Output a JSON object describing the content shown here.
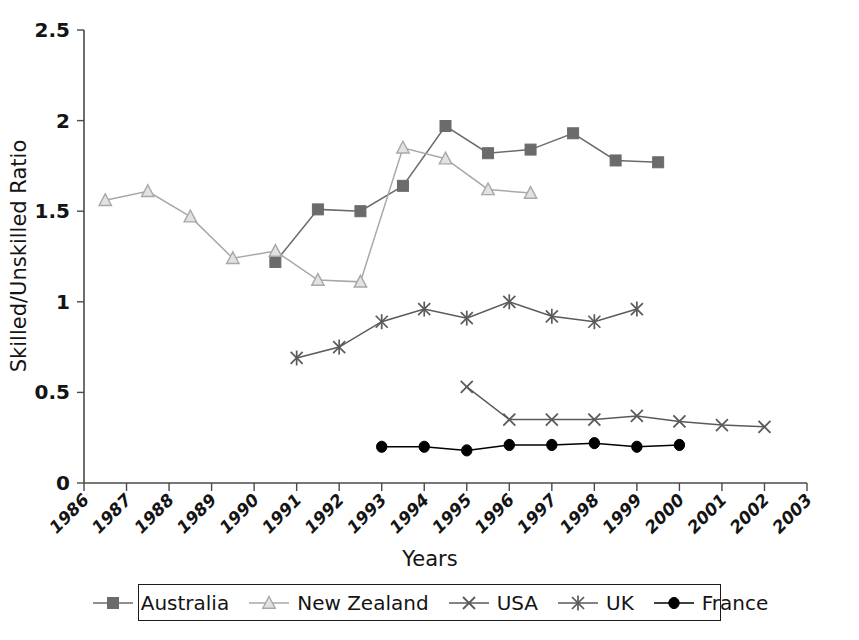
{
  "chart_data": {
    "type": "line",
    "title": "",
    "xlabel": "Years",
    "ylabel": "Skilled/Unskilled Ratio",
    "xlim": [
      1986,
      2003
    ],
    "ylim": [
      0,
      2.5
    ],
    "ytick_labels": [
      "0",
      "0.5",
      "1",
      "1.5",
      "2",
      "2.5"
    ],
    "ytick_values": [
      0,
      0.5,
      1,
      1.5,
      2,
      2.5
    ],
    "xtick_labels": [
      "1986",
      "1987",
      "1988",
      "1989",
      "1990",
      "1991",
      "1992",
      "1993",
      "1994",
      "1995",
      "1996",
      "1997",
      "1998",
      "1999",
      "2000",
      "2001",
      "2002",
      "2003"
    ],
    "grid": false,
    "legend_position": "bottom",
    "series": [
      {
        "name": "Australia",
        "marker": "filled-square",
        "color": "#6b6b6b",
        "points": [
          {
            "x": 1990.5,
            "y": 1.22
          },
          {
            "x": 1991.5,
            "y": 1.51
          },
          {
            "x": 1992.5,
            "y": 1.5
          },
          {
            "x": 1993.5,
            "y": 1.64
          },
          {
            "x": 1994.5,
            "y": 1.97
          },
          {
            "x": 1995.5,
            "y": 1.82
          },
          {
            "x": 1996.5,
            "y": 1.84
          },
          {
            "x": 1997.5,
            "y": 1.93
          },
          {
            "x": 1998.5,
            "y": 1.78
          },
          {
            "x": 1999.5,
            "y": 1.77
          }
        ]
      },
      {
        "name": "New Zealand",
        "marker": "open-triangle",
        "color": "#a8a8a8",
        "points": [
          {
            "x": 1986.5,
            "y": 1.56
          },
          {
            "x": 1987.5,
            "y": 1.61
          },
          {
            "x": 1988.5,
            "y": 1.47
          },
          {
            "x": 1989.5,
            "y": 1.24
          },
          {
            "x": 1990.5,
            "y": 1.28
          },
          {
            "x": 1991.5,
            "y": 1.12
          },
          {
            "x": 1992.5,
            "y": 1.11
          },
          {
            "x": 1993.5,
            "y": 1.85
          },
          {
            "x": 1994.5,
            "y": 1.79
          },
          {
            "x": 1995.5,
            "y": 1.62
          },
          {
            "x": 1996.5,
            "y": 1.6
          }
        ]
      },
      {
        "name": "USA",
        "marker": "cross",
        "color": "#5a5a5a",
        "points": [
          {
            "x": 1995.0,
            "y": 0.53
          },
          {
            "x": 1996.0,
            "y": 0.35
          },
          {
            "x": 1997.0,
            "y": 0.35
          },
          {
            "x": 1998.0,
            "y": 0.35
          },
          {
            "x": 1999.0,
            "y": 0.37
          },
          {
            "x": 2000.0,
            "y": 0.34
          },
          {
            "x": 2001.0,
            "y": 0.32
          },
          {
            "x": 2002.0,
            "y": 0.31
          }
        ]
      },
      {
        "name": "UK",
        "marker": "asterisk",
        "color": "#5a5a5a",
        "points": [
          {
            "x": 1991.0,
            "y": 0.69
          },
          {
            "x": 1992.0,
            "y": 0.75
          },
          {
            "x": 1993.0,
            "y": 0.89
          },
          {
            "x": 1994.0,
            "y": 0.96
          },
          {
            "x": 1995.0,
            "y": 0.91
          },
          {
            "x": 1996.0,
            "y": 1.0
          },
          {
            "x": 1997.0,
            "y": 0.92
          },
          {
            "x": 1998.0,
            "y": 0.89
          },
          {
            "x": 1999.0,
            "y": 0.96
          }
        ]
      },
      {
        "name": "France",
        "marker": "filled-circle",
        "color": "#000000",
        "points": [
          {
            "x": 1993.0,
            "y": 0.2
          },
          {
            "x": 1994.0,
            "y": 0.2
          },
          {
            "x": 1995.0,
            "y": 0.18
          },
          {
            "x": 1996.0,
            "y": 0.21
          },
          {
            "x": 1997.0,
            "y": 0.21
          },
          {
            "x": 1998.0,
            "y": 0.22
          },
          {
            "x": 1999.0,
            "y": 0.2
          },
          {
            "x": 2000.0,
            "y": 0.21
          }
        ]
      }
    ]
  },
  "legend": {
    "items": [
      {
        "label": "Australia",
        "marker": "filled-square",
        "color": "#6b6b6b"
      },
      {
        "label": "New Zealand",
        "marker": "open-triangle",
        "color": "#a8a8a8"
      },
      {
        "label": "USA",
        "marker": "cross",
        "color": "#5a5a5a"
      },
      {
        "label": "UK",
        "marker": "asterisk",
        "color": "#5a5a5a"
      },
      {
        "label": "France",
        "marker": "filled-circle",
        "color": "#000000"
      }
    ]
  }
}
